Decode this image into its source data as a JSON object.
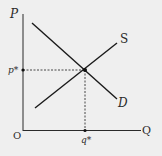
{
  "diagram": {
    "type": "supply-demand",
    "background": "#efefef",
    "line_color": "#1a1a1a",
    "axes": {
      "y_label": "P",
      "x_label": "Q",
      "origin_label": "O"
    },
    "equilibrium": {
      "price_label": "p*",
      "quantity_label": "q*"
    },
    "curves": [
      {
        "name": "supply",
        "label": "S"
      },
      {
        "name": "demand",
        "label": "D"
      }
    ]
  }
}
